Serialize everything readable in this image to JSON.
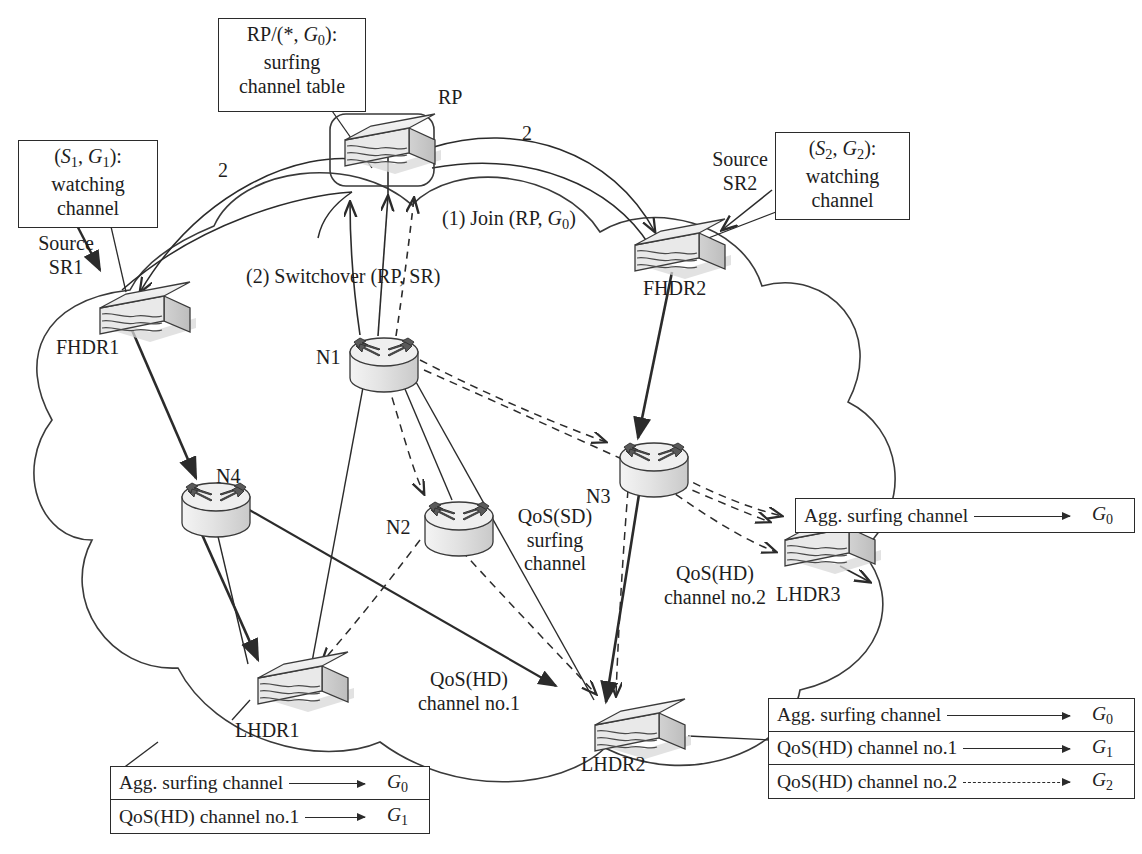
{
  "figure": {
    "kind": "network-diagram",
    "title_present": false,
    "background": "#ffffff",
    "ink": "#1d1d1d"
  },
  "annotations": {
    "rp_table_box": {
      "lines": [
        "RP/(*, G0):",
        "surfing",
        "channel table"
      ],
      "line1_parts": {
        "prefix": "RP/(*, ",
        "italic": "G",
        "sub": "0",
        "suffix": "):"
      }
    },
    "sr1_box": {
      "lines": [
        "(S1, G1):",
        "watching",
        "channel"
      ]
    },
    "sr2_box": {
      "lines": [
        "(S2, G2):",
        "watching",
        "channel"
      ]
    },
    "source_sr1": "Source\nSR1",
    "source_sr1_l1": "Source",
    "source_sr1_l2": "SR1",
    "source_sr2_l1": "Source",
    "source_sr2_l2": "SR2",
    "step1": "(1) Join (RP, G0)",
    "step2": "(2) Switchover (RP, SR)",
    "qos_sd": [
      "QoS(SD)",
      "surfing",
      "channel"
    ],
    "qos_hd_no1": [
      "QoS(HD)",
      "channel no.1"
    ],
    "qos_hd_no2": [
      "QoS(HD)",
      "channel no.2"
    ],
    "metric_left": "2",
    "metric_right": "2"
  },
  "devices": [
    {
      "id": "RP",
      "label": "RP",
      "type": "switch",
      "x": 335,
      "y": 120,
      "label_x": 440,
      "label_y": 88
    },
    {
      "id": "FHDR1",
      "label": "FHDR1",
      "type": "switch",
      "x": 90,
      "y": 288,
      "label_x": 58,
      "label_y": 338
    },
    {
      "id": "FHDR2",
      "label": "FHDR2",
      "type": "switch",
      "x": 625,
      "y": 225,
      "label_x": 645,
      "label_y": 279
    },
    {
      "id": "LHDR1",
      "label": "LHDR1",
      "type": "switch",
      "x": 248,
      "y": 658,
      "label_x": 237,
      "label_y": 721
    },
    {
      "id": "LHDR2",
      "label": "LHDR2",
      "type": "switch",
      "x": 585,
      "y": 705,
      "label_x": 583,
      "label_y": 755
    },
    {
      "id": "LHDR3",
      "label": "LHDR3",
      "type": "switch",
      "x": 775,
      "y": 520,
      "label_x": 778,
      "label_y": 585
    },
    {
      "id": "N1",
      "label": "N1",
      "type": "router",
      "x": 350,
      "y": 338,
      "label_x": 320,
      "label_y": 348
    },
    {
      "id": "N2",
      "label": "N2",
      "type": "router",
      "x": 425,
      "y": 502,
      "label_x": 389,
      "label_y": 518
    },
    {
      "id": "N3",
      "label": "N3",
      "type": "router",
      "x": 620,
      "y": 443,
      "label_x": 589,
      "label_y": 487
    },
    {
      "id": "N4",
      "label": "N4",
      "type": "router",
      "x": 182,
      "y": 483,
      "label_x": 219,
      "label_y": 468
    }
  ],
  "tables": {
    "lhdr3": {
      "name": "LHDR3 aggregate table",
      "rows": [
        {
          "name": "Agg. surfing channel",
          "arrow": "solid",
          "value": "G0",
          "value_italic": "G",
          "value_sub": "0"
        }
      ]
    },
    "lhdr2": {
      "name": "LHDR2 channel table",
      "rows": [
        {
          "name": "Agg. surfing channel",
          "arrow": "solid",
          "value": "G0",
          "value_italic": "G",
          "value_sub": "0"
        },
        {
          "name": "QoS(HD) channel no.1",
          "arrow": "solid",
          "value": "G1",
          "value_italic": "G",
          "value_sub": "1"
        },
        {
          "name": "QoS(HD) channel no.2",
          "arrow": "dashed",
          "value": "G2",
          "value_italic": "G",
          "value_sub": "2"
        }
      ]
    },
    "lhdr1": {
      "name": "LHDR1 channel table",
      "rows": [
        {
          "name": "Agg. surfing channel",
          "arrow": "solid",
          "value": "G0",
          "value_italic": "G",
          "value_sub": "0"
        },
        {
          "name": "QoS(HD) channel no.1",
          "arrow": "solid",
          "value": "G1",
          "value_italic": "G",
          "value_sub": "1"
        }
      ]
    }
  },
  "colors": {
    "line": "#2b2b2b",
    "device_fill_light": "#f2f2f2",
    "device_fill_mid": "#d9d9d9",
    "device_fill_dark": "#bdbdbd",
    "shadow": "#cccccc"
  }
}
